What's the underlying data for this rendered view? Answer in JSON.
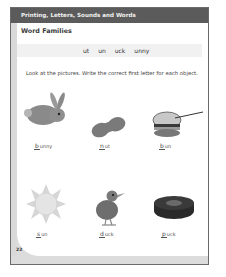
{
  "header": {
    "section": "Printing, Letters, Sounds and Words"
  },
  "title": "Word Families",
  "word_families": [
    "ut",
    "un",
    "uck",
    "unny"
  ],
  "instructions": "Look at the pictures. Write the correct first letter for each object.",
  "items": [
    {
      "picture": "rabbit-icon",
      "letter": "b",
      "ending": "unny"
    },
    {
      "picture": "peanut-icon",
      "letter": "n",
      "ending": "ut"
    },
    {
      "picture": "hamburger-bun-icon",
      "letter": "b",
      "ending": "un"
    },
    {
      "picture": "sun-icon",
      "letter": "s",
      "ending": "un"
    },
    {
      "picture": "duck-icon",
      "letter": "d",
      "ending": "uck"
    },
    {
      "picture": "hockey-puck-icon",
      "letter": "p",
      "ending": "uck"
    }
  ],
  "page_number": "22",
  "colors": {
    "header_band": "#5b5b5b",
    "left_stripe": "#d9d9d9",
    "families_band": "#f1f1f1"
  }
}
